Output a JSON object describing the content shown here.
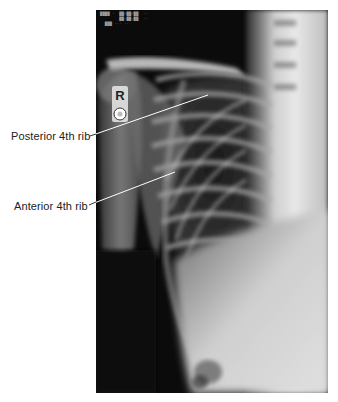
{
  "figure": {
    "type": "chest radiograph (right side, PA view)",
    "side_marker": "R",
    "film_header_text": [
      "████ ·  ██/██/██  ··",
      "        ██:██:██  ··",
      "  ███ ··· ··"
    ]
  },
  "labels": [
    {
      "id": "posterior",
      "text": "Posterior 4th rib",
      "target": "posterior-4th-rib"
    },
    {
      "id": "anterior",
      "text": "Anterior 4th rib",
      "target": "anterior-4th-rib"
    }
  ],
  "colors": {
    "background": "#ffffff",
    "film_dark": "#0b0b0b",
    "bone_light": "#e6e6e6",
    "label_text": "#222222",
    "leader_line": "#333333"
  }
}
